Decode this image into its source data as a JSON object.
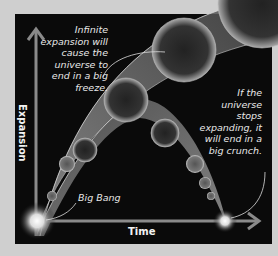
{
  "diagram": {
    "axes": {
      "x_label": "Time",
      "y_label": "Expansion"
    },
    "annotations": {
      "big_freeze": "Infinite expansion will cause the universe to end in a big freeze.",
      "big_crunch": "If the universe stops expanding, it will end in a big crunch.",
      "big_bang": "Big Bang"
    },
    "colors": {
      "background": "#cfcfcf",
      "panel": "#0a0a0a",
      "axis": "#8a8a8a",
      "band": "#7a7a7a",
      "text": "#e8e8e8"
    }
  }
}
